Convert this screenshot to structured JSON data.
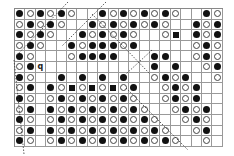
{
  "chart": {
    "columns": 20,
    "rows": 13,
    "legend": {
      "B": "black-dot",
      "W": "white-circle",
      "S": "black-square",
      "Q": "q-mark",
      "_": "empty"
    },
    "grid": [
      "BWBWBW__BWBWBWBW__BW",
      "WBWBW__BWBWBWBW__BWB",
      "BWBW__BWBWBW__WS_BWB",
      "WBW__BWBBBWB_____WBW",
      "BW___WBBBB___BB__WBW",
      "WBQ__________B_B__WB",
      "BW__B_B_B_B__WBWB__W",
      "WB_BWSWSWSWB__WBWB__",
      "BW_WBWBWBWBW__WBWB__",
      "WB_BWBWBWBWBW__WBWB_",
      "BW_WBWBWBWBWBW__WBW_",
      "WB_BWBWBWBWBWBW__WB_",
      "BW_WBWBWBWBWBWBW__W_"
    ],
    "q_label": "q"
  }
}
